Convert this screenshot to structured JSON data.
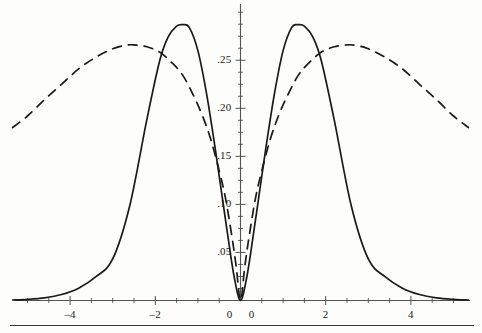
{
  "figure": {
    "background_color": "#fdfdfc",
    "ink_color": "#1a1a1a",
    "axis_color": "#55534f",
    "rule_color": "#3c3a38"
  },
  "chart_data": {
    "type": "line",
    "title": "",
    "subtitle": "",
    "xlabel": "",
    "ylabel": "",
    "xlim": [
      -5.35,
      5.35
    ],
    "ylim": [
      0,
      0.3
    ],
    "grid": false,
    "legend_position": "none",
    "x_ticks_major": [
      -4,
      -2,
      0,
      2,
      4
    ],
    "x_tick_labels": [
      "–4",
      "–2",
      "0",
      "2",
      "4"
    ],
    "x_origin_extra_label": "0",
    "x_minor_tick_step": 0.5,
    "y_ticks_major": [
      0.05,
      0.1,
      0.15,
      0.2,
      0.25
    ],
    "y_tick_labels": [
      ".05",
      ".10",
      ".15",
      ".20",
      ".25"
    ],
    "y_minor_tick_step": 0.0125,
    "series": [
      {
        "name": "solid-curve",
        "style": "solid",
        "color": "#1a1a1a",
        "peak_x": [
          -1.35,
          1.35
        ],
        "peak_y": 0.287,
        "x": [
          -5.35,
          -5.0,
          -4.6,
          -4.2,
          -3.8,
          -3.4,
          -3.0,
          -2.6,
          -2.2,
          -1.9,
          -1.7,
          -1.5,
          -1.35,
          -1.2,
          -1.0,
          -0.8,
          -0.6,
          -0.45,
          -0.3,
          -0.15,
          0.0,
          0.15,
          0.3,
          0.45,
          0.6,
          0.8,
          1.0,
          1.2,
          1.35,
          1.5,
          1.7,
          1.9,
          2.2,
          2.6,
          3.0,
          3.4,
          3.8,
          4.2,
          4.6,
          5.0,
          5.35
        ],
        "y": [
          0.0005,
          0.0012,
          0.0028,
          0.0062,
          0.0128,
          0.0245,
          0.0432,
          0.0986,
          0.188,
          0.249,
          0.274,
          0.2855,
          0.287,
          0.284,
          0.26,
          0.216,
          0.16,
          0.114,
          0.068,
          0.025,
          0.0,
          0.025,
          0.068,
          0.114,
          0.16,
          0.216,
          0.26,
          0.284,
          0.287,
          0.2855,
          0.274,
          0.249,
          0.188,
          0.0986,
          0.0432,
          0.0245,
          0.0128,
          0.0062,
          0.0028,
          0.0012,
          0.0005
        ]
      },
      {
        "name": "dashed-curve",
        "style": "dashed",
        "color": "#1a1a1a",
        "peak_x": [
          -2.5,
          2.5
        ],
        "peak_y": 0.266,
        "x": [
          -5.35,
          -5.0,
          -4.6,
          -4.2,
          -3.8,
          -3.4,
          -3.0,
          -2.7,
          -2.5,
          -2.2,
          -1.9,
          -1.6,
          -1.35,
          -1.1,
          -0.9,
          -0.7,
          -0.5,
          -0.35,
          -0.2,
          -0.1,
          0.0,
          0.1,
          0.2,
          0.35,
          0.5,
          0.7,
          0.9,
          1.1,
          1.35,
          1.6,
          1.9,
          2.2,
          2.5,
          2.7,
          3.0,
          3.4,
          3.8,
          4.2,
          4.6,
          5.0,
          5.35
        ],
        "y": [
          0.18,
          0.192,
          0.209,
          0.225,
          0.241,
          0.253,
          0.262,
          0.2655,
          0.266,
          0.264,
          0.2585,
          0.247,
          0.234,
          0.213,
          0.193,
          0.168,
          0.135,
          0.106,
          0.066,
          0.035,
          0.0,
          0.035,
          0.066,
          0.106,
          0.135,
          0.168,
          0.193,
          0.213,
          0.234,
          0.247,
          0.2585,
          0.264,
          0.266,
          0.2655,
          0.262,
          0.253,
          0.241,
          0.225,
          0.209,
          0.192,
          0.18
        ]
      }
    ],
    "annotations": []
  },
  "footer_rule": {
    "visible": true
  }
}
